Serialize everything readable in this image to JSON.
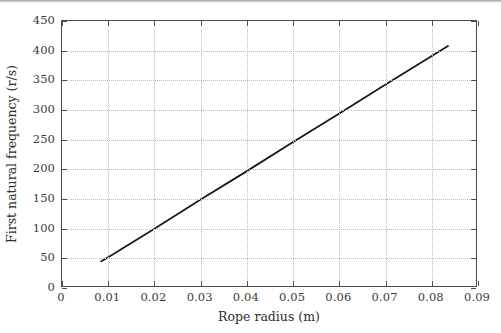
{
  "chart_data": {
    "type": "line",
    "title": "",
    "xlabel": "Rope radius (m)",
    "ylabel": "First natural frequency (r/s)",
    "xlim": [
      0,
      0.09
    ],
    "ylim": [
      0,
      450
    ],
    "xticks": [
      0,
      0.01,
      0.02,
      0.03,
      0.04,
      0.05,
      0.06,
      0.07,
      0.08,
      0.09
    ],
    "xtick_labels": [
      "0",
      "0.01",
      "0.02",
      "0.03",
      "0.04",
      "0.05",
      "0.06",
      "0.07",
      "0.08",
      "0.09"
    ],
    "yticks": [
      0,
      50,
      100,
      150,
      200,
      250,
      300,
      350,
      400,
      450
    ],
    "ytick_labels": [
      "0",
      "50",
      "100",
      "150",
      "200",
      "250",
      "300",
      "350",
      "400",
      "450"
    ],
    "grid": true,
    "grid_style": "dotted",
    "grid_color": "#bdbdbd",
    "legend": null,
    "line_color": "#1a1a1a",
    "line_width": 1.8,
    "series": [
      {
        "name": "First natural frequency vs rope radius",
        "x": [
          0.0085,
          0.01,
          0.02,
          0.03,
          0.04,
          0.05,
          0.06,
          0.07,
          0.08,
          0.0835
        ],
        "values": [
          45,
          52,
          100,
          149,
          197,
          246,
          294,
          343,
          391,
          408
        ]
      }
    ]
  },
  "axes": {
    "x_label": "Rope radius (m)",
    "y_label": "First natural frequency (r/s)"
  }
}
